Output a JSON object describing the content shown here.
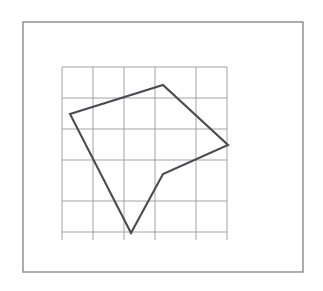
{
  "page": {
    "background_color": "#ffffff",
    "width": 323,
    "height": 291
  },
  "frame": {
    "name": "outer-border",
    "x": 23,
    "y": 22,
    "width": 280,
    "height": 250,
    "stroke_color": "#8a8a8a",
    "stroke_width": 1.4,
    "fill": "none"
  },
  "chart_data": {
    "type": "diagram",
    "grid": {
      "visible": true,
      "stroke_color": "#9a9a9a",
      "stroke_width": 0.9,
      "cell_size": 31,
      "x_lines": [
        62,
        93,
        124,
        155,
        196,
        227
      ],
      "y_lines": [
        67,
        98,
        129,
        160,
        201,
        232
      ],
      "x_extent": [
        62,
        227
      ],
      "y_extent": [
        67,
        240
      ],
      "columns": 5,
      "rows": 5
    },
    "shape": {
      "name": "pentagon",
      "closed": true,
      "fill": "none",
      "stroke_color": "#4a4a52",
      "stroke_width": 2.1,
      "vertices": [
        {
          "label": "A",
          "x": 70,
          "y": 114,
          "role": "left-vertex"
        },
        {
          "label": "B",
          "x": 163,
          "y": 85,
          "role": "top-vertex"
        },
        {
          "label": "C",
          "x": 228,
          "y": 145,
          "role": "right-vertex"
        },
        {
          "label": "D",
          "x": 163,
          "y": 174,
          "role": "concave-vertex"
        },
        {
          "label": "E",
          "x": 131,
          "y": 233,
          "role": "bottom-vertex"
        }
      ],
      "edges": [
        {
          "from": "A",
          "to": "B"
        },
        {
          "from": "B",
          "to": "C"
        },
        {
          "from": "C",
          "to": "D"
        },
        {
          "from": "D",
          "to": "E"
        },
        {
          "from": "E",
          "to": "A"
        }
      ]
    },
    "xlabel": "",
    "ylabel": "",
    "legend": [],
    "annotations": []
  }
}
